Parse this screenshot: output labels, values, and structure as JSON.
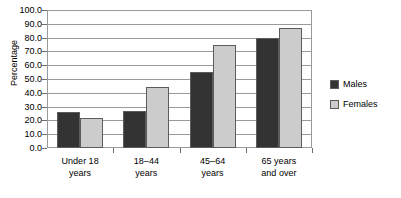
{
  "chart_data": {
    "type": "bar",
    "title": "",
    "xlabel": "",
    "ylabel": "Percentage",
    "ylim": [
      0,
      100
    ],
    "ytick_step": 10,
    "ytick_labels": [
      "0.0",
      "10.0",
      "20.0",
      "30.0",
      "40.0",
      "50.0",
      "60.0",
      "70.0",
      "80.0",
      "90.0",
      "100.0"
    ],
    "grid": true,
    "legend_position": "right",
    "categories": [
      {
        "line1": "Under 18",
        "line2": "years"
      },
      {
        "line1": "18–44",
        "line2": "years"
      },
      {
        "line1": "45–64",
        "line2": "years"
      },
      {
        "line1": "65 years",
        "line2": "and over"
      }
    ],
    "series": [
      {
        "name": "Males",
        "color": "#333333",
        "values": [
          26.0,
          27.0,
          55.0,
          80.0
        ]
      },
      {
        "name": "Females",
        "color": "#cccccc",
        "values": [
          22.0,
          44.0,
          75.0,
          87.0
        ]
      }
    ]
  },
  "legend": {
    "items": [
      {
        "label": "Males"
      },
      {
        "label": "Females"
      }
    ]
  },
  "colors": {
    "males": "#333333",
    "females": "#cccccc",
    "axis": "#9a9a9a",
    "tick": "#6e6e6e",
    "text": "#000000",
    "background": "#ffffff"
  }
}
